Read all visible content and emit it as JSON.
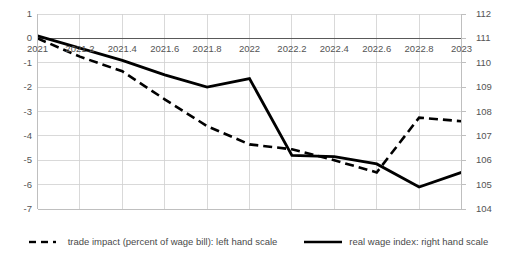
{
  "chart_data": {
    "type": "line",
    "title": "",
    "xlabel": "",
    "ylabel": "",
    "x": [
      2021,
      2021.2,
      2021.4,
      2021.6,
      2021.8,
      2022,
      2022.2,
      2022.4,
      2022.6,
      2022.8,
      2023
    ],
    "xticklabels": [
      "2021",
      "2021.2",
      "2021.4",
      "2021.6",
      "2021.8",
      "2022",
      "2022.2",
      "2022.4",
      "2022.6",
      "2022.8",
      "2023"
    ],
    "xlim": [
      2021,
      2023
    ],
    "grid": true,
    "legend_position": "bottom",
    "axes": [
      {
        "id": "left",
        "side": "left",
        "label": "",
        "ylim": [
          -7,
          1
        ],
        "yticks": [
          1,
          0,
          -1,
          -2,
          -3,
          -4,
          -5,
          -6,
          -7
        ],
        "yticklabels": [
          "1",
          "0",
          "-1",
          "-2",
          "-3",
          "-4",
          "-5",
          "-6",
          "-7"
        ]
      },
      {
        "id": "right",
        "side": "right",
        "label": "",
        "ylim": [
          104,
          112
        ],
        "yticks": [
          112,
          111,
          110,
          109,
          108,
          107,
          106,
          105,
          104
        ],
        "yticklabels": [
          "112",
          "111",
          "110",
          "109",
          "108",
          "107",
          "106",
          "105",
          "104"
        ]
      }
    ],
    "series": [
      {
        "name": "trade impact (percent of wage bill): left hand scale",
        "axis": "left",
        "style": "dashed",
        "color": "#000000",
        "values": [
          0.0,
          -0.75,
          -1.35,
          -2.5,
          -3.6,
          -4.35,
          -4.55,
          -5.0,
          -5.5,
          -3.25,
          -3.4
        ]
      },
      {
        "name": "real wage index: right hand scale",
        "axis": "right",
        "style": "solid",
        "color": "#000000",
        "values": [
          111.1,
          110.6,
          110.1,
          109.5,
          109.0,
          109.35,
          106.2,
          106.15,
          105.85,
          104.9,
          105.5
        ]
      }
    ]
  },
  "legend": {
    "items": [
      {
        "label": "trade impact (percent of wage bill): left hand scale",
        "style": "dashed"
      },
      {
        "label": "real wage index: right hand scale",
        "style": "solid"
      }
    ]
  },
  "colors": {
    "line": "#000000",
    "grid": "#d0d0d0",
    "axis": "#bfbfbf",
    "text": "#545454",
    "zero_line": "#595959"
  }
}
